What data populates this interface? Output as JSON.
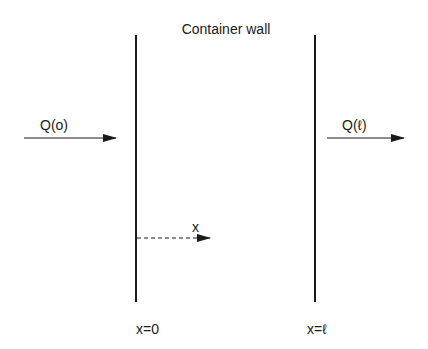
{
  "title": "Container wall",
  "labels": {
    "q_in": "Q(o)",
    "q_out": "Q(ℓ)",
    "x_axis": "x",
    "x_zero": "x=0",
    "x_ell": "x=ℓ"
  },
  "colors": {
    "ink": "#1a1a1a",
    "background": "#ffffff"
  }
}
